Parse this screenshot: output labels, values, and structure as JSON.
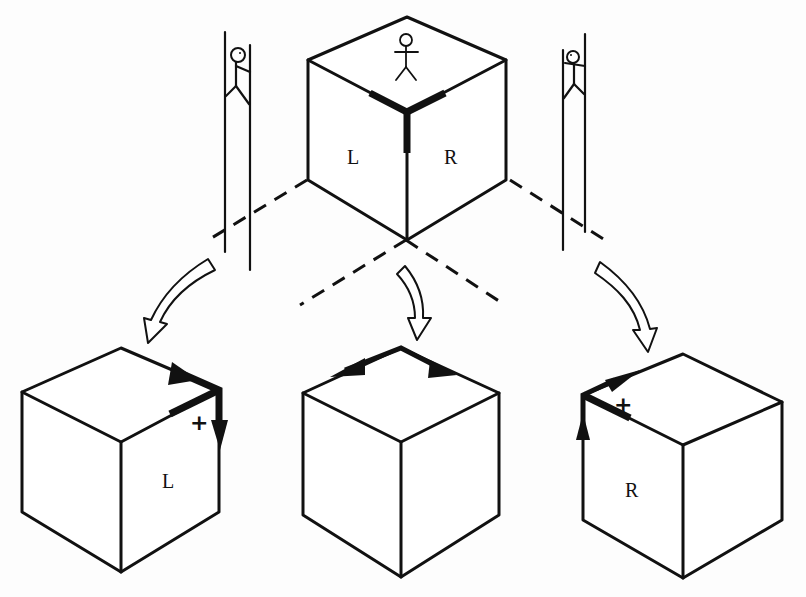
{
  "diagram": {
    "top_cube": {
      "face_left_label": "L",
      "face_right_label": "R",
      "figure": "stick-figure-on-top"
    },
    "left_cube": {
      "face_label": "L",
      "mark": "+"
    },
    "middle_cube": {
      "face_label": ""
    },
    "right_cube": {
      "face_label": "R",
      "mark": "+"
    },
    "left_observer": "stick-figure-on-left-wall",
    "right_observer": "stick-figure-on-right-wall",
    "colors": {
      "ink": "#111111",
      "paper": "#fdfdfd"
    }
  }
}
